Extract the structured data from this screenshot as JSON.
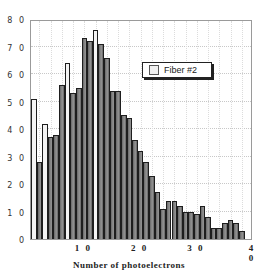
{
  "chart_data": {
    "type": "bar",
    "title": "",
    "xlabel": "Number of photoelectrons",
    "ylabel": "",
    "xlim": [
      0.5,
      40
    ],
    "ylim": [
      0,
      80
    ],
    "x_ticks": [
      "10",
      "20",
      "30",
      "40"
    ],
    "y_ticks": [
      "0",
      "10",
      "20",
      "30",
      "40",
      "50",
      "60",
      "70",
      "80"
    ],
    "grid": true,
    "legend_position": "upper right",
    "series": [
      {
        "name": "Fiber #2",
        "x": [
          1,
          2,
          3,
          4,
          5,
          6,
          7,
          8,
          9,
          10,
          11,
          12,
          13,
          14,
          15,
          16,
          17,
          18,
          19,
          20,
          21,
          22,
          23,
          24,
          25,
          26,
          27,
          28,
          29,
          30,
          31,
          32,
          33,
          34,
          35,
          36,
          37,
          38
        ],
        "values": [
          51,
          28,
          42,
          37,
          38,
          56,
          64,
          53,
          55,
          73,
          72,
          76,
          71,
          66,
          54,
          54,
          45,
          44,
          36,
          32,
          28,
          23,
          17,
          11,
          14,
          14,
          12,
          10,
          10,
          9,
          12,
          8,
          4,
          4,
          6,
          7,
          6,
          3
        ]
      }
    ]
  },
  "legend": {
    "label": "Fiber #2"
  },
  "axes": {
    "xlabel": "Number of photoelectrons",
    "y_ticks": [
      "0",
      "1 0",
      "2 0",
      "3 0",
      "4 0",
      "5 0",
      "6 0",
      "7 0",
      "8 0"
    ],
    "x_ticks": [
      "1 0",
      "2 0",
      "3 0",
      "4 0"
    ]
  }
}
